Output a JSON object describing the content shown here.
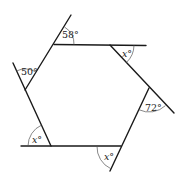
{
  "diagram": {
    "type": "hexagon-exterior-angles",
    "colors": {
      "line": "#1a1a1a",
      "arc": "#555555",
      "text": "#222222",
      "background": "#ffffff"
    },
    "angles": [
      {
        "id": "top-left",
        "label": "58°",
        "value": 58
      },
      {
        "id": "top-right",
        "label": "x°",
        "value": "x"
      },
      {
        "id": "right",
        "label": "72°",
        "value": 72
      },
      {
        "id": "bottom-right",
        "label": "x°",
        "value": "x"
      },
      {
        "id": "bottom-left",
        "label": "x°",
        "value": "x"
      },
      {
        "id": "left",
        "label": "50°",
        "value": 50
      }
    ]
  }
}
